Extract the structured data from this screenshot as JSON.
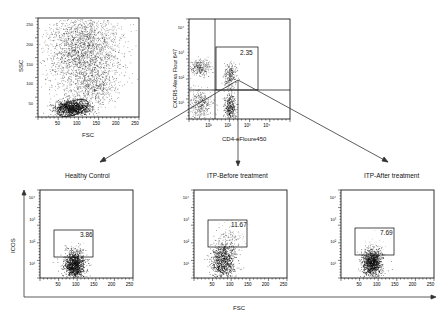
{
  "figure": {
    "flow_arrows": [
      "Healthy Control",
      "ITP-Before treatment",
      "ITP-After treatment"
    ]
  },
  "chart_data": [
    {
      "type": "scatter",
      "id": "gating-fsc-ssc",
      "title": "",
      "xlabel": "FSC",
      "ylabel": "SSC",
      "xticks": [
        "50",
        "100",
        "150",
        "200",
        "250"
      ],
      "yticks": [
        "50",
        "100",
        "150",
        "200",
        "250"
      ],
      "xlim": [
        0,
        262
      ],
      "ylim": [
        0,
        262
      ],
      "gate": {
        "shape": "ellipse",
        "label": "lymphocytes",
        "center": [
          80,
          30
        ]
      },
      "clusters": [
        {
          "name": "granulocytes",
          "center": [
            100,
            165
          ],
          "spread": [
            45,
            55
          ],
          "density": "high"
        },
        {
          "name": "monocytes",
          "center": [
            140,
            70
          ],
          "spread": [
            20,
            20
          ],
          "density": "medium"
        },
        {
          "name": "lymphocytes",
          "center": [
            80,
            30
          ],
          "spread": [
            18,
            10
          ],
          "density": "very high"
        }
      ]
    },
    {
      "type": "scatter",
      "id": "gating-cd4-cxcr5",
      "xlabel": "CD4-eFloure450",
      "ylabel": "CXCR5-Alexa Flour 647",
      "xticks": [
        "10^1",
        "10^2",
        "10^3",
        "10^4"
      ],
      "yticks": [
        "10^1",
        "10^2",
        "10^3",
        "10^4"
      ],
      "scale": "log",
      "gate": {
        "shape": "rectangle",
        "label": "CD4+CXCR5+",
        "value": 2.35
      },
      "clusters": [
        {
          "name": "CD4-CXCR5+",
          "center": [
            "10^1",
            "10^3"
          ],
          "density": "medium"
        },
        {
          "name": "CD4-CXCR5-",
          "center": [
            "10^1",
            "10^1"
          ],
          "density": "medium"
        },
        {
          "name": "CD4+CXCR5+",
          "center": [
            "10^2",
            "10^2.5"
          ],
          "density": "medium"
        },
        {
          "name": "CD4+CXCR5-",
          "center": [
            "10^2",
            "10^1"
          ],
          "density": "high"
        }
      ]
    },
    {
      "type": "scatter",
      "id": "healthy-control",
      "title": "Healthy Control",
      "xlabel": "FSC",
      "ylabel": "ICOS",
      "xticks": [
        "50",
        "100",
        "150",
        "200",
        "250"
      ],
      "yticks": [
        "10^1",
        "10^2",
        "10^3",
        "10^4"
      ],
      "gate": {
        "shape": "rectangle",
        "value": 3.86
      }
    },
    {
      "type": "scatter",
      "id": "itp-before",
      "title": "ITP-Before treatment",
      "xlabel": "FSC",
      "ylabel": "ICOS",
      "xticks": [
        "50",
        "100",
        "150",
        "200",
        "250"
      ],
      "yticks": [
        "10^1",
        "10^2",
        "10^3",
        "10^4"
      ],
      "gate": {
        "shape": "rectangle",
        "value": 11.67
      }
    },
    {
      "type": "scatter",
      "id": "itp-after",
      "title": "ITP-After treatment",
      "xlabel": "FSC",
      "ylabel": "ICOS",
      "xticks": [
        "50",
        "100",
        "150",
        "200",
        "250"
      ],
      "yticks": [
        "10^1",
        "10^2",
        "10^3",
        "10^4"
      ],
      "gate": {
        "shape": "rectangle",
        "value": 7.69
      }
    }
  ],
  "labels": {
    "p1_x": "FSC",
    "p1_y": "SSC",
    "p2_x": "CD4-eFloure450",
    "p2_y": "CXCR5-Alexa Flour 647",
    "p2_gate": "2.35",
    "t1": "Healthy Control",
    "t2": "ITP-Before treatment",
    "t3": "ITP-After treatment",
    "g1": "3.86",
    "g2": "11.67",
    "g3": "7.69",
    "shared_y": "ICOS",
    "shared_x": "FSC",
    "lin_ticks": [
      "50",
      "100",
      "150",
      "200",
      "250"
    ],
    "log_ticks": [
      "10¹",
      "10²",
      "10³",
      "10⁴"
    ]
  }
}
